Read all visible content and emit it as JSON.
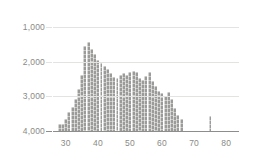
{
  "chart_data": {
    "type": "bar",
    "title": "",
    "subtitle": "",
    "xlabel": "",
    "ylabel": "",
    "orientation": "inverted-y",
    "grid": true,
    "legend": null,
    "xlim": [
      26,
      84
    ],
    "ylim": [
      4000,
      600
    ],
    "y_axis_inverted": true,
    "y_ticks": [
      1000,
      2000,
      3000,
      4000
    ],
    "y_tick_labels": [
      "1,000",
      "2,000",
      "3,000",
      "4,000"
    ],
    "x_ticks": [
      30,
      40,
      50,
      60,
      70,
      80
    ],
    "x_tick_labels": [
      "30",
      "40",
      "50",
      "60",
      "70",
      "80"
    ],
    "bar_color": "#9b9b99",
    "gridline_color": "#e3e3e1",
    "axis_color": "#8d8d8b",
    "tick_label_color": "#8a8a86",
    "categories": [
      28,
      29,
      30,
      31,
      32,
      33,
      34,
      35,
      36,
      37,
      38,
      39,
      40,
      41,
      42,
      43,
      44,
      45,
      46,
      47,
      48,
      49,
      50,
      51,
      52,
      53,
      54,
      55,
      56,
      57,
      58,
      59,
      60,
      61,
      62,
      63,
      64,
      65,
      66,
      75
    ],
    "values": [
      3790,
      3810,
      3640,
      3450,
      3300,
      3080,
      2780,
      2400,
      1560,
      1430,
      1640,
      1790,
      1940,
      2030,
      2120,
      2210,
      2320,
      2430,
      2460,
      2400,
      2340,
      2380,
      2300,
      2260,
      2300,
      2460,
      2540,
      2420,
      2290,
      2560,
      2700,
      2840,
      2900,
      2980,
      2880,
      3080,
      3340,
      3530,
      3640,
      3560
    ]
  }
}
